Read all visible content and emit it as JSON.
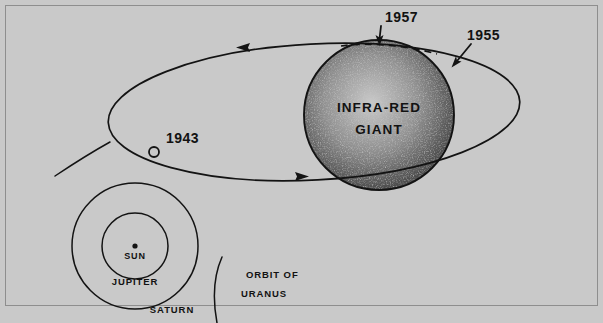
{
  "figure": {
    "background_color": "#c9c9c9",
    "ink_color": "#131313",
    "frame_color": "#5d5d5d"
  },
  "giant": {
    "label_line1": "INFRA-RED",
    "label_line2": "GIANT",
    "center_x": 379,
    "center_y": 115,
    "radius": 75,
    "fill_color": "#c2c2c2"
  },
  "orbit": {
    "name": "comet-orbit-ellipse",
    "center_x": 314,
    "center_y": 112,
    "radius_x": 206,
    "radius_y": 68,
    "rotation_deg": -3,
    "hidden_segment_style": "dashed"
  },
  "annotations": [
    {
      "id": "year-1957",
      "label": "1957",
      "label_x": 385,
      "label_y": 22,
      "arrow_from_x": 381,
      "arrow_from_y": 27,
      "arrow_to_x": 379,
      "arrow_to_y": 45,
      "direction": "down"
    },
    {
      "id": "year-1955",
      "label": "1955",
      "label_x": 465,
      "label_y": 40,
      "arrow_from_x": 470,
      "arrow_from_y": 45,
      "arrow_to_x": 452,
      "arrow_to_y": 68,
      "direction": "down-left"
    },
    {
      "id": "year-1943",
      "label": "1943",
      "label_x": 166,
      "label_y": 143,
      "marker_x": 154,
      "marker_y": 152,
      "marker_radius": 5,
      "marker_type": "open-circle"
    }
  ],
  "direction_arrows": [
    {
      "id": "orbit-arrow-outbound",
      "at_x": 243,
      "at_y": 47,
      "points": "left"
    },
    {
      "id": "orbit-arrow-inbound",
      "at_x": 301,
      "at_y": 177,
      "points": "right"
    }
  ],
  "solar_system_inset": {
    "sun": {
      "label": "SUN",
      "x": 135,
      "y": 246,
      "dot_radius": 2.6,
      "label_x": 135,
      "label_y": 258
    },
    "orbits": [
      {
        "label": "JUPITER",
        "radius": 33,
        "label_x": 135,
        "label_y": 284
      },
      {
        "label": "SATURN",
        "radius": 63,
        "label_x": 170,
        "label_y": 312
      }
    ],
    "uranus": {
      "label_line1": "ORBIT  OF",
      "label_line2": "URANUS",
      "label_x": 245,
      "label_y": 277,
      "label2_y": 296
    }
  },
  "stray_arc": {
    "id": "uranus-arc-upper-left",
    "from_x": 55,
    "from_y": 176,
    "to_x": 110,
    "to_y": 142
  }
}
